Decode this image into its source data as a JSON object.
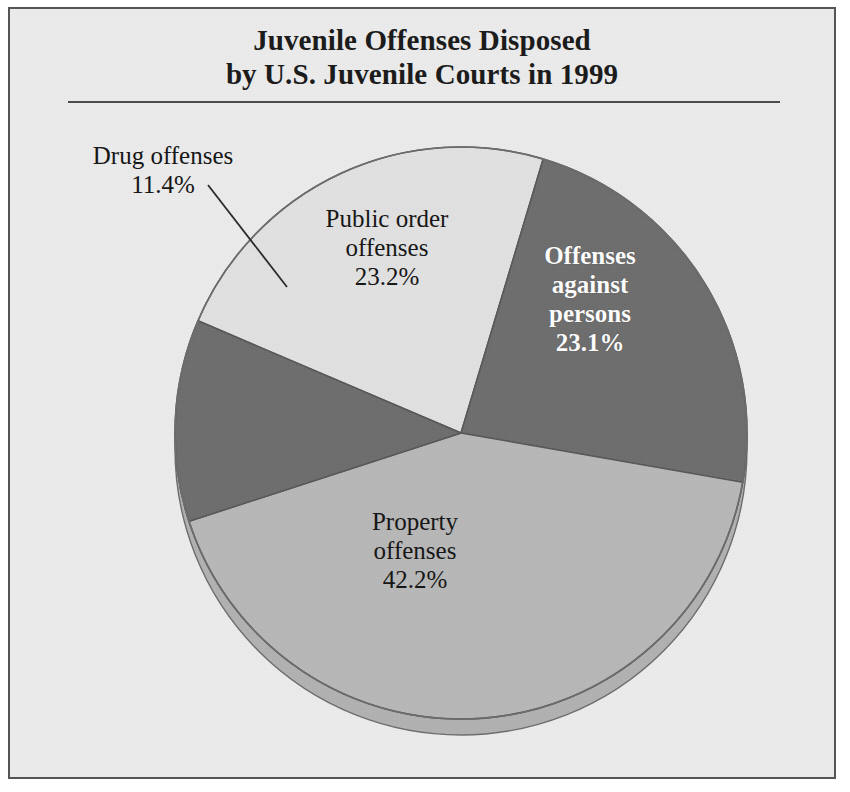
{
  "figure": {
    "title_line_1": "Juvenile Offenses Disposed",
    "title_line_2": "by U.S. Juvenile Courts in 1999"
  },
  "colors": {
    "background": "#ececec",
    "frame_border": "#555555",
    "title_rule": "#4c4c4c",
    "slice_light": "#e2e2e2",
    "slice_medium": "#b8b8b8",
    "slice_dark": "#6e6e6e",
    "slice_outline": "#585858",
    "depth_shadow": "#b2b2b2",
    "leader_line": "#2a2a2a",
    "label_text": "#151515",
    "label_text_on_dark": "#ffffff"
  },
  "labels": {
    "drug": {
      "name_line": "Drug offenses",
      "value_line": "11.4%"
    },
    "public_order": {
      "name_line_1": "Public order",
      "name_line_2": "offenses",
      "value_line": "23.2%"
    },
    "persons": {
      "name_line_1": "Offenses",
      "name_line_2": "against",
      "name_line_3": "persons",
      "value_line": "23.1%"
    },
    "property": {
      "name_line_1": "Property",
      "name_line_2": "offenses",
      "value_line": "42.2%"
    }
  },
  "chart_data": {
    "type": "pie",
    "title": "Juvenile Offenses Disposed by U.S. Juvenile Courts in 1999",
    "subtitle": "",
    "xlabel": "",
    "ylabel": "",
    "units": "percent",
    "total": 99.9,
    "legend_position": "none (direct slice labels)",
    "grid": false,
    "labels": [
      "Offenses against persons",
      "Property offenses",
      "Drug offenses",
      "Public order offenses"
    ],
    "values": [
      23.1,
      42.2,
      11.4,
      23.2
    ],
    "value_strings": [
      "23.1%",
      "42.2%",
      "11.4%",
      "23.2%"
    ],
    "slice_fills": [
      "#6e6e6e",
      "#b8b8b8",
      "#6e6e6e",
      "#e2e2e2"
    ],
    "label_text_colors": [
      "#ffffff",
      "#151515",
      "#151515",
      "#151515"
    ],
    "start_angle_deg_from_12oclock_clockwise": 16.7,
    "direction": "clockwise",
    "slices": [
      {
        "label": "Offenses against persons",
        "value": 23.1,
        "value_string": "23.1%",
        "fill": "#6e6e6e",
        "label_placement": "inside",
        "label_color": "#ffffff"
      },
      {
        "label": "Property offenses",
        "value": 42.2,
        "value_string": "42.2%",
        "fill": "#b8b8b8",
        "label_placement": "inside",
        "label_color": "#151515"
      },
      {
        "label": "Drug offenses",
        "value": 11.4,
        "value_string": "11.4%",
        "fill": "#6e6e6e",
        "label_placement": "outside-with-leader-line",
        "label_color": "#151515"
      },
      {
        "label": "Public order offenses",
        "value": 23.2,
        "value_string": "23.2%",
        "fill": "#e2e2e2",
        "label_placement": "inside",
        "label_color": "#151515"
      }
    ]
  }
}
